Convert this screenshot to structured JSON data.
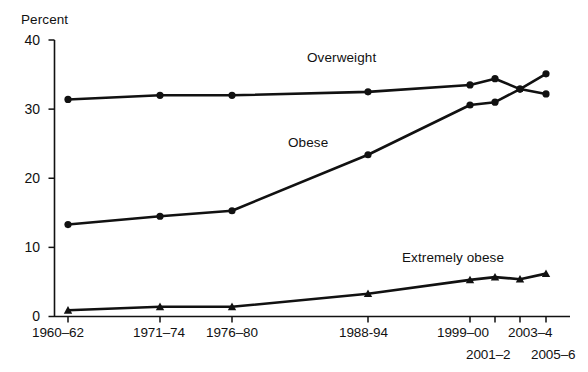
{
  "chart_data": {
    "type": "line",
    "title": "",
    "xlabel": "",
    "ylabel": "Percent",
    "ylim": [
      0,
      40
    ],
    "yticks": [
      0,
      10,
      20,
      30,
      40
    ],
    "grid": false,
    "legend": "inline-annotations",
    "categories": [
      "1960–62",
      "1971–74",
      "1976–80",
      "1988-94",
      "1999–00",
      "2001–2",
      "2003–4",
      "2005–6"
    ],
    "series": [
      {
        "name": "Overweight",
        "values": [
          31.4,
          32.0,
          32.0,
          32.5,
          33.5,
          34.4,
          32.9,
          32.2
        ]
      },
      {
        "name": "Obese",
        "values": [
          13.3,
          14.5,
          15.3,
          23.4,
          30.6,
          31.0,
          32.9,
          35.1
        ]
      },
      {
        "name": "Extremely obese",
        "values": [
          0.9,
          1.4,
          1.4,
          3.3,
          5.3,
          5.7,
          5.4,
          6.2
        ]
      }
    ],
    "annotations": [
      {
        "text": "Overweight",
        "series": "Overweight"
      },
      {
        "text": "Obese",
        "series": "Obese"
      },
      {
        "text": "Extremely obese",
        "series": "Extremely obese"
      }
    ]
  },
  "axes": {
    "y_title": "Percent",
    "y_tick_labels": [
      "40",
      "30",
      "20",
      "10",
      "0"
    ],
    "x_tick_labels_row1": [
      "1960–62",
      "1971–74",
      "1976–80",
      "1988-94",
      "1999–00",
      "2003–4"
    ],
    "x_tick_labels_row2": [
      "2001–2",
      "2005–6"
    ]
  },
  "series_labels": {
    "overweight": "Overweight",
    "obese": "Obese",
    "extremely_obese": "Extremely obese"
  },
  "colors": {
    "line": "#111111",
    "axis": "#111111",
    "background": "#ffffff"
  }
}
